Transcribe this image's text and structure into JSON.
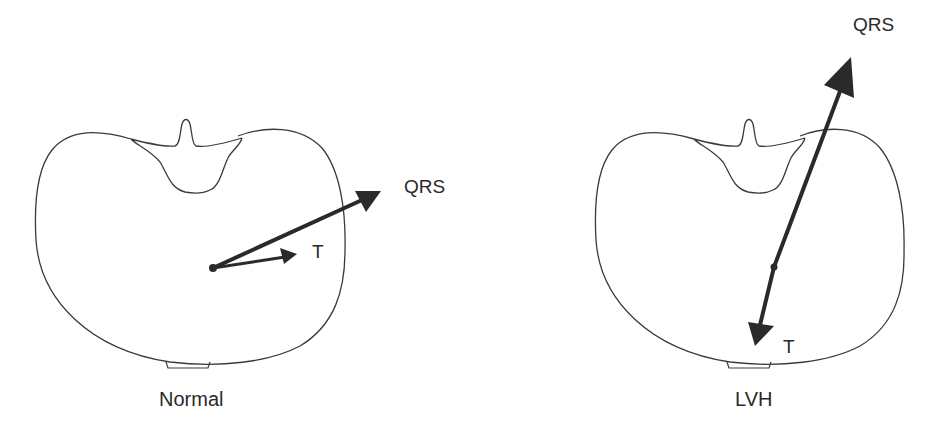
{
  "figure": {
    "type": "diagram",
    "colors": {
      "outline": "#3a3a3a",
      "vector": "#2a2a2a",
      "background": "#ffffff"
    }
  },
  "panels": [
    {
      "caption": "Normal",
      "vectors": [
        {
          "label": "QRS",
          "kind": "qrs-arrow"
        },
        {
          "label": "T",
          "kind": "t-arrow"
        }
      ]
    },
    {
      "caption": "LVH",
      "vectors": [
        {
          "label": "QRS",
          "kind": "qrs-arrow"
        },
        {
          "label": "T",
          "kind": "t-arrow"
        }
      ]
    }
  ]
}
